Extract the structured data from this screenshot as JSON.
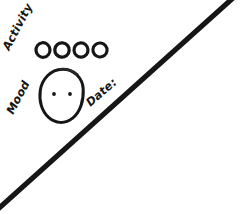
{
  "page": {
    "medium": "hand-drawn pen sketch",
    "background_color": "#ffffff",
    "ink_color": "#161616",
    "width": 249,
    "height": 214
  },
  "labels": {
    "activity": "Activity",
    "mood": "Mood",
    "date": "Date:"
  },
  "activity_row": {
    "label": "Activity",
    "icon_name": "activity-circle-icon",
    "count": 4,
    "checked_count": 0,
    "circles": [
      {
        "id": 1,
        "filled": false,
        "cx": 43,
        "cy": 50,
        "r": 7.1
      },
      {
        "id": 2,
        "filled": false,
        "cx": 62,
        "cy": 50,
        "r": 7.1
      },
      {
        "id": 3,
        "filled": false,
        "cx": 81,
        "cy": 50,
        "r": 7.1
      },
      {
        "id": 4,
        "filled": false,
        "cx": 100,
        "cy": 50,
        "r": 7.1
      }
    ]
  },
  "mood_face": {
    "label": "Mood",
    "icon_name": "neutral-face-icon",
    "expression": "neutral",
    "has_mouth": false,
    "eyes": [
      {
        "id": "left-eye",
        "cx": 54,
        "cy": 94,
        "r": 1.9
      },
      {
        "id": "right-eye",
        "cx": 70,
        "cy": 94,
        "r": 1.9
      }
    ],
    "outline": {
      "cx": 62,
      "cy": 96,
      "rx": 21,
      "ry": 27
    }
  },
  "date_rule": {
    "label": "Date:",
    "icon_name": "diagonal-rule-line",
    "value": "",
    "placeholder": "",
    "from": {
      "x": -2,
      "y": 209
    },
    "to": {
      "x": 233,
      "y": -2
    },
    "stroke_width": 5
  }
}
